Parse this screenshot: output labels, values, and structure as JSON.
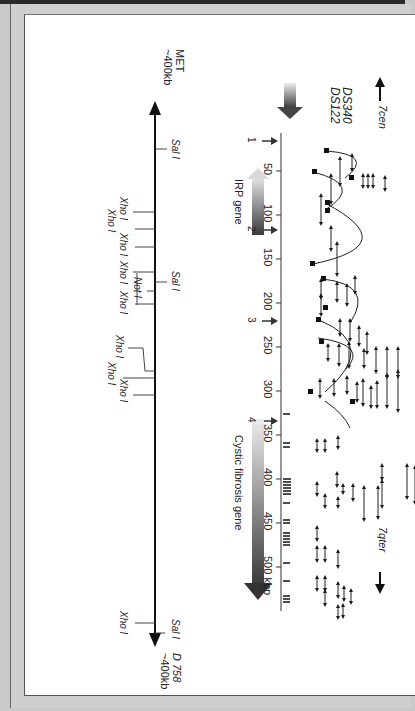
{
  "figure": {
    "orientation": "rotated-90-clockwise",
    "top_markers": {
      "ds340": "DS340",
      "ds122": "DS122",
      "cen": "7cen",
      "qter": "7qter"
    },
    "scale": {
      "ticks": [
        "50",
        "100",
        "150",
        "200",
        "250",
        "300",
        "350",
        "400",
        "450",
        "500 kbp"
      ]
    },
    "breakpoints": [
      {
        "label": "1"
      },
      {
        "label": "2"
      },
      {
        "label": "3"
      },
      {
        "label": "4"
      }
    ],
    "genes": {
      "irp": "IRP gene",
      "cf": "Cystic fibrosis gene"
    },
    "restriction_map": {
      "left_end": {
        "name": "MET",
        "distance": "~400kb"
      },
      "right_end": {
        "name": "D 758",
        "distance": "~400kb"
      },
      "sites": [
        {
          "enzyme": "Sal I",
          "side": "top"
        },
        {
          "enzyme": "Xho I",
          "side": "bottom"
        },
        {
          "enzyme": "Xho I",
          "side": "bottom"
        },
        {
          "enzyme": "Xho I",
          "side": "bottom"
        },
        {
          "enzyme": "Xho I",
          "side": "bottom"
        },
        {
          "enzyme": "Sal I",
          "side": "top"
        },
        {
          "enzyme": "Not I",
          "side": "bottom"
        },
        {
          "enzyme": "Xho I",
          "side": "bottom"
        },
        {
          "enzyme": "Xho I",
          "side": "bottom"
        },
        {
          "enzyme": "Xho I",
          "side": "bottom"
        },
        {
          "enzyme": "Xho I",
          "side": "bottom"
        },
        {
          "enzyme": "Sal I",
          "side": "top"
        },
        {
          "enzyme": "Xho I",
          "side": "bottom"
        }
      ]
    },
    "colors": {
      "ink": "#1a1a1a",
      "gradient_dark": "#3a3a3a",
      "gradient_light": "#e6e6e6",
      "page": "#ffffff",
      "border": "#c9c9c9"
    }
  }
}
